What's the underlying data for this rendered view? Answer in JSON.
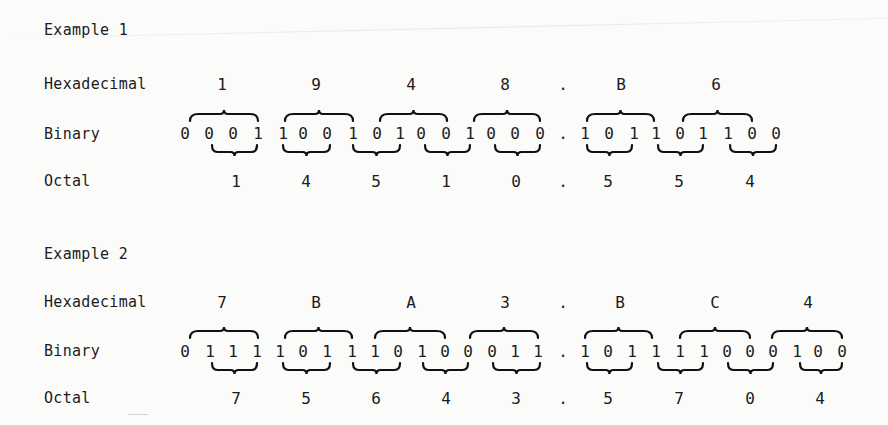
{
  "examples": [
    {
      "title": "Example 1",
      "labels": {
        "hex": "Hexadecimal",
        "binary": "Binary",
        "octal": "Octal"
      },
      "hex": [
        {
          "v": "1",
          "x": 222
        },
        {
          "v": "9",
          "x": 316
        },
        {
          "v": "4",
          "x": 411
        },
        {
          "v": "8",
          "x": 505
        },
        {
          "v": ".",
          "x": 563
        },
        {
          "v": "B",
          "x": 621
        },
        {
          "v": "6",
          "x": 716
        }
      ],
      "binary": [
        {
          "v": "0",
          "x": 185
        },
        {
          "v": "0",
          "x": 209
        },
        {
          "v": "0",
          "x": 233
        },
        {
          "v": "1",
          "x": 258
        },
        {
          "v": "1",
          "x": 283
        },
        {
          "v": "0",
          "x": 303
        },
        {
          "v": "0",
          "x": 327
        },
        {
          "v": "1",
          "x": 353
        },
        {
          "v": "0",
          "x": 377
        },
        {
          "v": "1",
          "x": 400
        },
        {
          "v": "0",
          "x": 421
        },
        {
          "v": "0",
          "x": 446
        },
        {
          "v": "1",
          "x": 470
        },
        {
          "v": "0",
          "x": 491
        },
        {
          "v": "0",
          "x": 515
        },
        {
          "v": "0",
          "x": 540
        },
        {
          "v": ".",
          "x": 563
        },
        {
          "v": "1",
          "x": 585
        },
        {
          "v": "0",
          "x": 609
        },
        {
          "v": "1",
          "x": 634
        },
        {
          "v": "1",
          "x": 656
        },
        {
          "v": "0",
          "x": 680
        },
        {
          "v": "1",
          "x": 703
        },
        {
          "v": "1",
          "x": 728
        },
        {
          "v": "0",
          "x": 752
        },
        {
          "v": "0",
          "x": 776
        }
      ],
      "octal": [
        {
          "v": "1",
          "x": 236
        },
        {
          "v": "4",
          "x": 306
        },
        {
          "v": "5",
          "x": 376
        },
        {
          "v": "1",
          "x": 446
        },
        {
          "v": "0",
          "x": 516
        },
        {
          "v": ".",
          "x": 563
        },
        {
          "v": "5",
          "x": 608
        },
        {
          "v": "5",
          "x": 679
        },
        {
          "v": "4",
          "x": 750
        }
      ],
      "hex_braces": [
        [
          190,
          258
        ],
        [
          285,
          353
        ],
        [
          380,
          447
        ],
        [
          474,
          540
        ],
        [
          587,
          654
        ],
        [
          683,
          752
        ]
      ],
      "octal_braces": [
        [
          212,
          257
        ],
        [
          283,
          330
        ],
        [
          353,
          400
        ],
        [
          425,
          470
        ],
        [
          495,
          540
        ],
        [
          587,
          632
        ],
        [
          658,
          703
        ],
        [
          730,
          776
        ]
      ]
    },
    {
      "title": "Example 2",
      "labels": {
        "hex": "Hexadecimal",
        "binary": "Binary",
        "octal": "Octal"
      },
      "hex": [
        {
          "v": "7",
          "x": 222
        },
        {
          "v": "B",
          "x": 316
        },
        {
          "v": "A",
          "x": 411
        },
        {
          "v": "3",
          "x": 505
        },
        {
          "v": ".",
          "x": 563
        },
        {
          "v": "B",
          "x": 620
        },
        {
          "v": "C",
          "x": 715
        },
        {
          "v": "4",
          "x": 808
        }
      ],
      "binary": [
        {
          "v": "0",
          "x": 185
        },
        {
          "v": "1",
          "x": 210
        },
        {
          "v": "1",
          "x": 233
        },
        {
          "v": "1",
          "x": 257
        },
        {
          "v": "1",
          "x": 280
        },
        {
          "v": "0",
          "x": 303
        },
        {
          "v": "1",
          "x": 327
        },
        {
          "v": "1",
          "x": 352
        },
        {
          "v": "1",
          "x": 375
        },
        {
          "v": "0",
          "x": 398
        },
        {
          "v": "1",
          "x": 422
        },
        {
          "v": "0",
          "x": 445
        },
        {
          "v": "0",
          "x": 468
        },
        {
          "v": "0",
          "x": 492
        },
        {
          "v": "1",
          "x": 515
        },
        {
          "v": "1",
          "x": 538
        },
        {
          "v": ".",
          "x": 563
        },
        {
          "v": "1",
          "x": 585
        },
        {
          "v": "0",
          "x": 608
        },
        {
          "v": "1",
          "x": 632
        },
        {
          "v": "1",
          "x": 656
        },
        {
          "v": "1",
          "x": 680
        },
        {
          "v": "1",
          "x": 704
        },
        {
          "v": "0",
          "x": 727
        },
        {
          "v": "0",
          "x": 750
        },
        {
          "v": "0",
          "x": 773
        },
        {
          "v": "1",
          "x": 797
        },
        {
          "v": "0",
          "x": 818
        },
        {
          "v": "0",
          "x": 842
        }
      ],
      "octal": [
        {
          "v": "7",
          "x": 236
        },
        {
          "v": "5",
          "x": 306
        },
        {
          "v": "6",
          "x": 376
        },
        {
          "v": "4",
          "x": 446
        },
        {
          "v": "3",
          "x": 516
        },
        {
          "v": ".",
          "x": 563
        },
        {
          "v": "5",
          "x": 608
        },
        {
          "v": "7",
          "x": 679
        },
        {
          "v": "0",
          "x": 750
        },
        {
          "v": "4",
          "x": 820
        }
      ],
      "hex_braces": [
        [
          190,
          258
        ],
        [
          285,
          352
        ],
        [
          375,
          445
        ],
        [
          470,
          538
        ],
        [
          585,
          652
        ],
        [
          680,
          750
        ],
        [
          772,
          842
        ]
      ],
      "octal_braces": [
        [
          212,
          257
        ],
        [
          283,
          330
        ],
        [
          353,
          400
        ],
        [
          423,
          468
        ],
        [
          493,
          540
        ],
        [
          587,
          632
        ],
        [
          658,
          703
        ],
        [
          728,
          773
        ],
        [
          800,
          842
        ]
      ]
    }
  ]
}
